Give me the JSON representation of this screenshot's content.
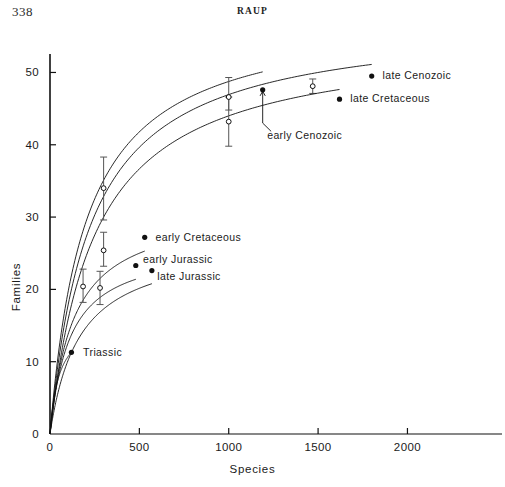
{
  "page": {
    "folio": "338",
    "running_head": "RAUP"
  },
  "chart_data": {
    "type": "line",
    "title": "",
    "xlabel": "Species",
    "ylabel": "Families",
    "xlim": [
      0,
      2350
    ],
    "ylim": [
      0,
      52
    ],
    "xticks": [
      0,
      500,
      1000,
      1500,
      2000
    ],
    "xtick_labels": [
      "0",
      "500",
      "1000",
      "1500",
      "2000"
    ],
    "yticks": [
      0,
      10,
      20,
      30,
      40,
      50
    ],
    "ytick_labels": [
      "0",
      "10",
      "20",
      "30",
      "40",
      "50"
    ],
    "grid": false,
    "legend": "inline-labels-at-curve-ends",
    "series": [
      {
        "name": "late Cenozoic",
        "label": "late Cenozoic",
        "label_x": 1860,
        "label_y": 49.6,
        "endpoint": {
          "x": 1800,
          "y": 49.5,
          "marker": "filled-dot"
        },
        "curve_max_families": 57.5,
        "curve_half_saturation": 225,
        "error_bars": [
          {
            "x": 1470,
            "y": 48.1,
            "low": 47.1,
            "high": 49.1,
            "marker": "open-circle"
          }
        ]
      },
      {
        "name": "late Cretaceous",
        "label": "late Cretaceous",
        "label_x": 1680,
        "label_y": 46.4,
        "endpoint": {
          "x": 1620,
          "y": 46.3,
          "marker": "filled-dot"
        },
        "curve_max_families": 55.0,
        "curve_half_saturation": 250,
        "error_bars": [
          {
            "x": 1000,
            "y": 43.2,
            "low": 39.8,
            "high": 46.6,
            "marker": "open-circle"
          }
        ]
      },
      {
        "name": "early Cenozoic",
        "label": "early Cenozoic",
        "label_x": 1215,
        "label_y": 41.3,
        "leader_from": {
          "x": 1190,
          "y": 43.0
        },
        "leader_to": {
          "x": 1190,
          "y": 47.4
        },
        "endpoint": {
          "x": 1190,
          "y": 47.6,
          "marker": "filled-dot"
        },
        "curve_max_families": 58.5,
        "curve_half_saturation": 200,
        "error_bars": [
          {
            "x": 1000,
            "y": 46.6,
            "low": 44.8,
            "high": 49.3,
            "marker": "open-circle"
          },
          {
            "x": 300,
            "y": 34.0,
            "low": 29.6,
            "high": 38.3,
            "marker": "open-circle"
          }
        ]
      },
      {
        "name": "early Cretaceous",
        "label": "early Cretaceous",
        "label_x": 590,
        "label_y": 27.3,
        "endpoint": {
          "x": 530,
          "y": 27.2,
          "marker": "filled-dot"
        },
        "curve_max_families": 31.5,
        "curve_half_saturation": 130,
        "error_bars": [
          {
            "x": 300,
            "y": 25.4,
            "low": 23.2,
            "high": 27.9,
            "marker": "open-circle"
          }
        ]
      },
      {
        "name": "early Jurassic",
        "label": "early Jurassic",
        "label_x": 520,
        "label_y": 24.2,
        "endpoint": {
          "x": 480,
          "y": 23.3,
          "marker": "filled-dot"
        },
        "curve_max_families": 26.3,
        "curve_half_saturation": 110,
        "error_bars": [
          {
            "x": 185,
            "y": 20.4,
            "low": 18.2,
            "high": 22.8,
            "marker": "open-circle"
          }
        ]
      },
      {
        "name": "late Jurassic",
        "label": "late Jurassic",
        "label_x": 600,
        "label_y": 21.8,
        "endpoint": {
          "x": 570,
          "y": 22.6,
          "marker": "filled-dot"
        },
        "curve_max_families": 26.8,
        "curve_half_saturation": 165,
        "error_bars": [
          {
            "x": 280,
            "y": 20.2,
            "low": 17.9,
            "high": 22.5,
            "marker": "open-circle"
          }
        ]
      },
      {
        "name": "Triassic",
        "label": "Triassic",
        "label_x": 185,
        "label_y": 11.4,
        "endpoint": {
          "x": 120,
          "y": 11.3,
          "marker": "filled-dot"
        },
        "curve_max_families": 16.0,
        "curve_half_saturation": 50,
        "error_bars": []
      }
    ]
  }
}
